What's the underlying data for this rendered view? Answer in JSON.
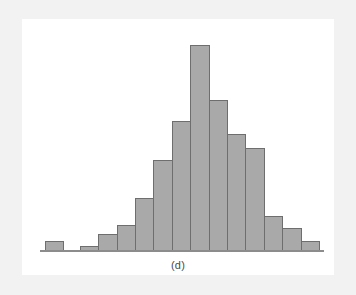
{
  "figure": {
    "caption": "(d)",
    "colors": {
      "bar_fill": "#a9a9a9",
      "bar_stroke": "#6e6e6e",
      "baseline": "#8c8c8c",
      "page_background": "#ffffff",
      "margin_band": "#f2f2f2"
    }
  },
  "chart_data": {
    "type": "bar",
    "title": "",
    "subtitle": "",
    "annotations": [
      "(d)"
    ],
    "xlabel": "",
    "ylabel": "",
    "grid": false,
    "legend": null,
    "axis": {
      "x_axis_visible": true,
      "y_axis_visible": false,
      "x_tick_labels": [],
      "y_tick_labels": []
    },
    "ylim": [
      0,
      210
    ],
    "note": "Unlabeled bell-shaped histogram; bar heights read in pixels from the baseline, normalized to the tallest bar = 205.",
    "categories": [
      "bin-1",
      "bin-2",
      "bin-3",
      "bin-4",
      "bin-5",
      "bin-6",
      "bin-7",
      "bin-8",
      "bin-9",
      "bin-10",
      "bin-11",
      "bin-12",
      "bin-13",
      "bin-14",
      "bin-15"
    ],
    "values": [
      9,
      0,
      4,
      16,
      25,
      52,
      90,
      129,
      205,
      150,
      116,
      102,
      34,
      22,
      9
    ]
  }
}
